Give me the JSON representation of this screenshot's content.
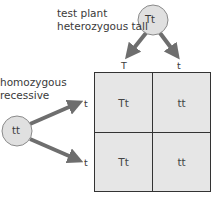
{
  "labels": {
    "test_plant_line1": "test plant",
    "test_plant_line2": "heterozygous tall",
    "recessive_line1": "homozygous",
    "recessive_line2": "recessive"
  },
  "parents": {
    "top": {
      "genotype": "Tt",
      "gametes": [
        "T",
        "t"
      ]
    },
    "left": {
      "genotype": "tt",
      "gametes": [
        "t",
        "t"
      ]
    }
  },
  "punnett": {
    "cells": [
      [
        "Tt",
        "tt"
      ],
      [
        "Tt",
        "tt"
      ]
    ]
  },
  "colors": {
    "circle_fill": "#e0e0e0",
    "circle_stroke": "#8a8a8a",
    "arrow": "#6e6e6e",
    "cell_fill": "#e6e6e6",
    "grid_line": "#333333"
  }
}
